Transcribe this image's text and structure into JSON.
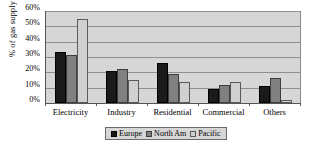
{
  "chart_data": {
    "type": "bar",
    "title": "",
    "subtitle": "",
    "xlabel": "",
    "ylabel": "% of gas supply",
    "ylim": [
      0,
      60
    ],
    "ytick_labels": [
      "60%",
      "50%",
      "40%",
      "30%",
      "20%",
      "10%",
      "0%"
    ],
    "ytick_values": [
      60,
      50,
      40,
      30,
      20,
      10,
      0
    ],
    "grid": true,
    "grid_axis": "y",
    "legend_position": "bottom",
    "categories": [
      "Electricity",
      "Industry",
      "Residential",
      "Commercial",
      "Others"
    ],
    "series": [
      {
        "name": "Europe",
        "color": "#1a1a1a",
        "values": [
          33,
          21,
          26,
          9,
          11
        ]
      },
      {
        "name": "North Am",
        "color": "#808080",
        "values": [
          31,
          22,
          19,
          12,
          16
        ]
      },
      {
        "name": "Pacific",
        "color": "#d0d0d0",
        "values": [
          55,
          15,
          14,
          14,
          2
        ]
      }
    ],
    "units": "percent",
    "plot_background": "#d6d6d6",
    "page_background": "#ffffff"
  },
  "legend": {
    "entries": [
      {
        "label": "Europe"
      },
      {
        "label": "North Am"
      },
      {
        "label": "Pacific"
      }
    ]
  },
  "axes": {
    "y_title": "% of gas supply",
    "y_ticks": [
      "60%",
      "50%",
      "40%",
      "30%",
      "20%",
      "10%",
      "0%"
    ],
    "x_labels": [
      "Electricity",
      "Industry",
      "Residential",
      "Commercial",
      "Others"
    ]
  }
}
